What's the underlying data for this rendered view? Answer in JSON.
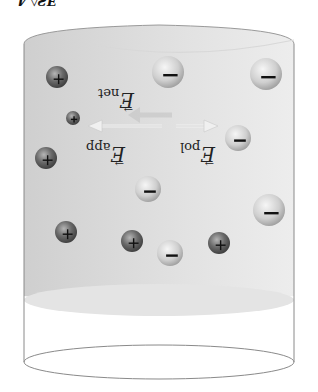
{
  "figure": {
    "caption_clipped": "…ƎƧ◊ 4 …",
    "orientation": "rotated-180",
    "colors": {
      "medium_fill": "#d9d9d9",
      "outline": "#8a8a8a",
      "surface_ellipse": "#e4e4e4",
      "positive_ion": "#5a5a5a",
      "negative_ion": "#c4c4c4",
      "arrow": "#e8e8e8"
    }
  },
  "labels": {
    "e_net": {
      "symbol": "E",
      "subscript": "net",
      "vector": "→"
    },
    "e_app": {
      "symbol": "E",
      "subscript": "app",
      "vector": "→"
    },
    "e_pol": {
      "symbol": "E",
      "subscript": "pol",
      "vector": "→"
    }
  },
  "ions": {
    "positive_sign": "+",
    "negative_sign": "−",
    "positive": [
      {
        "x": 57,
        "y": 77,
        "r": 11
      },
      {
        "x": 73,
        "y": 118,
        "r": 7
      },
      {
        "x": 46,
        "y": 158,
        "r": 11
      },
      {
        "x": 66,
        "y": 232,
        "r": 11
      },
      {
        "x": 132,
        "y": 241,
        "r": 11
      },
      {
        "x": 219,
        "y": 243,
        "r": 11
      }
    ],
    "negative": [
      {
        "x": 168,
        "y": 72,
        "r": 16
      },
      {
        "x": 266,
        "y": 74,
        "r": 16
      },
      {
        "x": 238,
        "y": 138,
        "r": 13
      },
      {
        "x": 148,
        "y": 189,
        "r": 13
      },
      {
        "x": 269,
        "y": 210,
        "r": 16
      },
      {
        "x": 170,
        "y": 253,
        "r": 13
      }
    ]
  },
  "arrows": {
    "e_app": {
      "x1": 160,
      "y1": 126,
      "x2": 92,
      "y2": 126
    },
    "e_pol": {
      "x1": 178,
      "y1": 126,
      "x2": 214,
      "y2": 126
    },
    "e_net": {
      "x1": 170,
      "y1": 115,
      "x2": 138,
      "y2": 115
    }
  }
}
